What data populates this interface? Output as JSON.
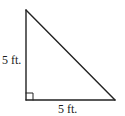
{
  "diagram": {
    "type": "right-triangle",
    "shape_color": "#222222",
    "vertices": {
      "top": [
        26,
        10
      ],
      "right_angle": [
        26,
        100
      ],
      "bottom_right": [
        115,
        100
      ]
    },
    "right_angle_marker_size": 7,
    "labels": {
      "left_side": "5 ft.",
      "bottom_side": "5 ft."
    }
  }
}
